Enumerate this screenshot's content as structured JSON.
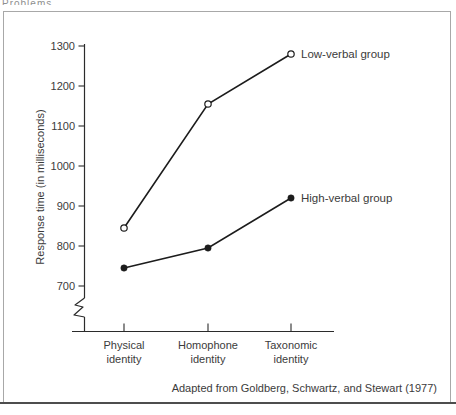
{
  "page": {
    "header_fragment": "Problems",
    "caption": "Adapted from Goldberg, Schwartz, and Stewart (1977)"
  },
  "colors": {
    "line": "#1c1c1c",
    "text": "#3b3b3b",
    "box_border": "#a8a8a8",
    "bottom_rule": "#4d4d4d"
  },
  "chart_data": {
    "type": "line",
    "title": "",
    "xlabel": "",
    "ylabel": "Response time (in milliseconds)",
    "categories": [
      [
        "Physical",
        "identity"
      ],
      [
        "Homophone",
        "identity"
      ],
      [
        "Taxonomic",
        "identity"
      ]
    ],
    "series": [
      {
        "name": "Low-verbal group",
        "marker": "open-circle",
        "values": [
          845,
          1155,
          1280
        ]
      },
      {
        "name": "High-verbal group",
        "marker": "filled-circle",
        "values": [
          745,
          795,
          920
        ]
      }
    ],
    "yticks": [
      1300,
      1200,
      1100,
      1000,
      900,
      800,
      700
    ],
    "ylim": [
      700,
      1300
    ],
    "axis_break": true,
    "grid": false,
    "legend_position": "right-of-last-point"
  }
}
